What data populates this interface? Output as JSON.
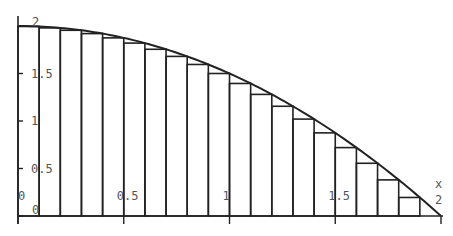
{
  "chart_data": {
    "type": "area",
    "title": "",
    "function": "2 - x^2/2",
    "n_rectangles": 20,
    "xlabel": "x",
    "ylabel": "",
    "xlim": [
      0,
      2
    ],
    "ylim": [
      0,
      2
    ],
    "x_ticks": [
      "0",
      "0.5",
      "1",
      "1.5",
      "2"
    ],
    "y_ticks": [
      "0",
      "0.5",
      "1",
      "1.5",
      "2"
    ],
    "x": [
      0.1,
      0.2,
      0.3,
      0.4,
      0.5,
      0.6,
      0.7,
      0.8,
      0.9,
      1.0,
      1.1,
      1.2,
      1.3,
      1.4,
      1.5,
      1.6,
      1.7,
      1.8,
      1.9,
      2.0
    ],
    "values": [
      1.995,
      1.98,
      1.955,
      1.92,
      1.875,
      1.82,
      1.755,
      1.68,
      1.595,
      1.5,
      1.395,
      1.28,
      1.155,
      1.02,
      0.875,
      0.72,
      0.555,
      0.38,
      0.195,
      0.0
    ],
    "grid": false,
    "legend": null
  },
  "style": {
    "line_color": "#222222",
    "label_color": "#555555"
  }
}
